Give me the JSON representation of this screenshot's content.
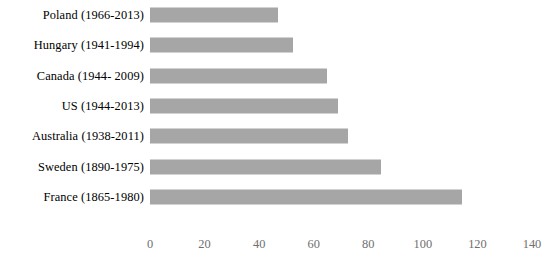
{
  "chart_data": {
    "type": "bar",
    "orientation": "horizontal",
    "title": "",
    "xlabel": "",
    "ylabel": "",
    "xlim": [
      0,
      140
    ],
    "xticks": [
      0,
      20,
      40,
      60,
      80,
      100,
      120,
      140
    ],
    "grid": false,
    "legend": null,
    "bar_color": "#a6a6a6",
    "tick_label_color": "#6f6f6f",
    "category_label_color": "#000000",
    "background_color": "#ffffff",
    "categories": [
      "Poland (1966-2013)",
      "Hungary (1941-1994)",
      "Canada (1944- 2009)",
      "US (1944-2013)",
      "Australia (1938-2011)",
      "Sweden (1890-1975)",
      "France (1865-1980)"
    ],
    "values": [
      47,
      52.5,
      65,
      69,
      72.5,
      84.5,
      114.5
    ],
    "series": [
      {
        "name": "",
        "values": [
          47,
          52.5,
          65,
          69,
          72.5,
          84.5,
          114.5
        ]
      }
    ],
    "points": [
      {
        "category": "Poland (1966-2013)",
        "value": 47
      },
      {
        "category": "Hungary (1941-1994)",
        "value": 52.5
      },
      {
        "category": "Canada (1944- 2009)",
        "value": 65
      },
      {
        "category": "US (1944-2013)",
        "value": 69
      },
      {
        "category": "Australia (1938-2011)",
        "value": 72.5
      },
      {
        "category": "Sweden (1890-1975)",
        "value": 84.5
      },
      {
        "category": "France (1865-1980)",
        "value": 114.5
      }
    ]
  },
  "axis": {
    "tick_labels": [
      "0",
      "20",
      "40",
      "60",
      "80",
      "100",
      "120",
      "140"
    ]
  }
}
